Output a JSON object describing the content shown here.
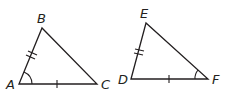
{
  "diagram": {
    "type": "congruent-triangles",
    "triangles": [
      {
        "name": "ABC",
        "vertices": {
          "A": "A",
          "B": "B",
          "C": "C"
        },
        "marks": {
          "AB": "double-tick",
          "AC": "single-tick",
          "angle_A": "single-arc"
        }
      },
      {
        "name": "DEF",
        "vertices": {
          "D": "D",
          "E": "E",
          "F": "F"
        },
        "marks": {
          "DE": "double-tick",
          "DF": "single-tick",
          "angle_F": "single-arc"
        }
      }
    ],
    "colors": {
      "stroke": "#231f20",
      "background": "#ffffff"
    }
  }
}
